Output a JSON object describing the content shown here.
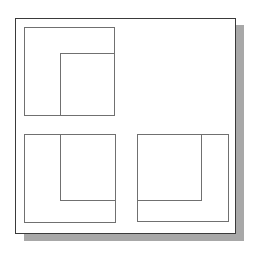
{
  "diagram": {
    "type": "orthographic-projection-views",
    "frame": {
      "x": 15,
      "y": 18,
      "width": 221,
      "height": 216,
      "stroke": "#3a3a3a"
    },
    "shadow": {
      "offset_x": 9,
      "offset_y": 8,
      "color": "#a8a8a8"
    },
    "line_color": "#707070",
    "views": [
      {
        "name": "top-view",
        "outer": {
          "x": 24,
          "y": 27,
          "width": 90,
          "height": 88
        },
        "inner": {
          "x": 60,
          "y": 53,
          "width": 54,
          "height": 62
        }
      },
      {
        "name": "front-view",
        "outer": {
          "x": 24,
          "y": 134,
          "width": 91,
          "height": 88
        },
        "inner": {
          "x": 60,
          "y": 134,
          "width": 55,
          "height": 66
        }
      },
      {
        "name": "side-view",
        "outer": {
          "x": 137,
          "y": 134,
          "width": 91,
          "height": 87
        },
        "inner": {
          "x": 137,
          "y": 134,
          "width": 64,
          "height": 66
        }
      }
    ]
  }
}
